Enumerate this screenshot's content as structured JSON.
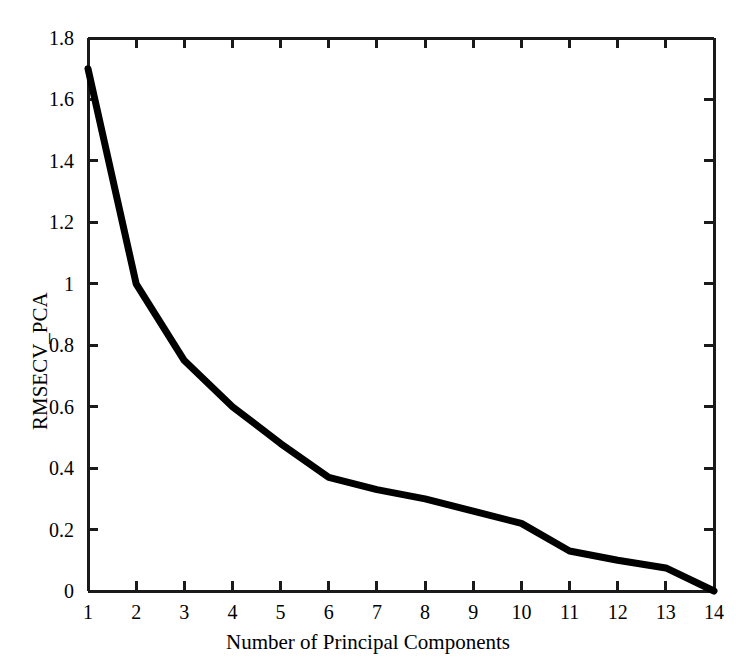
{
  "chart_data": {
    "type": "line",
    "title": "",
    "xlabel": "Number of Principal Components",
    "ylabel": "RMSECV_PCA",
    "x": [
      1,
      2,
      3,
      4,
      5,
      6,
      7,
      8,
      9,
      10,
      11,
      12,
      13,
      14
    ],
    "values": [
      1.7,
      1.0,
      0.75,
      0.6,
      0.48,
      0.37,
      0.33,
      0.3,
      0.26,
      0.22,
      0.13,
      0.1,
      0.075,
      0.0
    ],
    "series": [
      {
        "name": "RMSECV_PCA",
        "values": [
          1.7,
          1.0,
          0.75,
          0.6,
          0.48,
          0.37,
          0.33,
          0.3,
          0.26,
          0.22,
          0.13,
          0.1,
          0.075,
          0.0
        ]
      }
    ],
    "xlim": [
      1,
      14
    ],
    "ylim": [
      0,
      1.8
    ],
    "xticks": [
      1,
      2,
      3,
      4,
      5,
      6,
      7,
      8,
      9,
      10,
      11,
      12,
      13,
      14
    ],
    "xtick_labels": [
      "1",
      "2",
      "3",
      "4",
      "5",
      "6",
      "7",
      "8",
      "9",
      "10",
      "11",
      "12",
      "13",
      "14"
    ],
    "yticks": [
      0,
      0.2,
      0.4,
      0.6,
      0.8,
      1.0,
      1.2,
      1.4,
      1.6,
      1.8
    ],
    "ytick_labels": [
      "0",
      "0.2",
      "0.4",
      "0.6",
      "0.8",
      "1",
      "1.2",
      "1.4",
      "1.6",
      "1.8"
    ],
    "grid": false,
    "legend": false,
    "line_color": "#000000",
    "line_width": 7,
    "axis_color": "#1a1a1a",
    "background_color": "#ffffff"
  }
}
